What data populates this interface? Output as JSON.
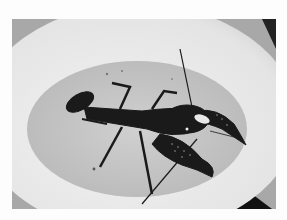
{
  "image": {
    "subject": "crayfish in a white bowl of water",
    "colors": {
      "background": "#fdfdfd",
      "bowl_rim": "#e6e6e6",
      "water": "#c4c4c4",
      "crayfish": "#1a1a1a",
      "corner_dark": "#222222"
    }
  }
}
